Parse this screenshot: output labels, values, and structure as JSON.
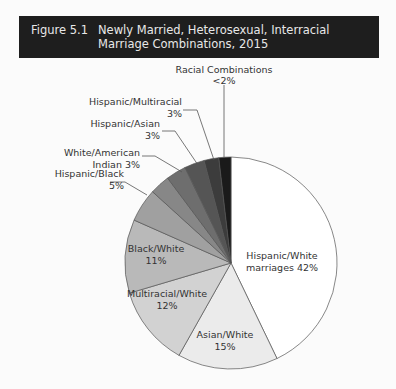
{
  "header": {
    "figure_number": "Figure 5.1",
    "title": "Newly Married, Heterosexual, Interracial Marriage Combinations, 2015"
  },
  "chart_data": {
    "type": "pie",
    "title": "Newly Married, Heterosexual, Interracial Marriage Combinations, 2015",
    "start_angle": "12 o'clock, clockwise",
    "slices": [
      {
        "label": "Hispanic/White marriages",
        "value": 42,
        "display": "42%",
        "color": "#ffffff"
      },
      {
        "label": "Asian/White",
        "value": 15,
        "display": "15%",
        "color": "#ebebeb"
      },
      {
        "label": "Multiracial/White",
        "value": 12,
        "display": "12%",
        "color": "#d2d2d2"
      },
      {
        "label": "Black/White",
        "value": 11,
        "display": "11%",
        "color": "#b9b9b9"
      },
      {
        "label": "Hispanic/Black",
        "value": 5,
        "display": "5%",
        "color": "#a0a0a0"
      },
      {
        "label": "White/American Indian",
        "value": 3,
        "display": "3%",
        "color": "#878787"
      },
      {
        "label": "Hispanic/Asian",
        "value": 3,
        "display": "3%",
        "color": "#6e6e6e"
      },
      {
        "label": "Hispanic/Multiracial",
        "value": 3,
        "display": "3%",
        "color": "#555555"
      },
      {
        "label": "(unlabeled)",
        "value": 2.2,
        "display": "",
        "color": "#3c3c3c"
      },
      {
        "label": "Racial Combinations",
        "value": 1.8,
        "display": "<2%",
        "color": "#1a1a1a"
      }
    ]
  },
  "labels": {
    "hispanic_white": [
      "Hispanic/White",
      "marriages 42%"
    ],
    "asian_white": [
      "Asian/White",
      "15%"
    ],
    "multiracial_white": [
      "Multiracial/White",
      "12%"
    ],
    "black_white": [
      "Black/White",
      "11%"
    ],
    "hispanic_black": [
      "Hispanic/Black",
      "5%"
    ],
    "white_american_indian": [
      "White/American",
      "Indian 3%"
    ],
    "hispanic_asian": [
      "Hispanic/Asian",
      "3%"
    ],
    "hispanic_multiracial": [
      "Hispanic/Multiracial",
      "3%"
    ],
    "racial_combinations": [
      "Racial Combinations",
      "<2%"
    ]
  }
}
